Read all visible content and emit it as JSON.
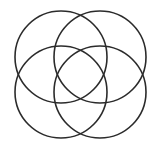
{
  "diagram": {
    "type": "four-circle-venn",
    "background": "#ffffff",
    "stroke_color": "#2b2b2b",
    "stroke_width": 1.6,
    "circles": [
      {
        "name": "top-left",
        "cx": 61,
        "cy": 57,
        "r": 46
      },
      {
        "name": "top-right",
        "cx": 100,
        "cy": 57,
        "r": 46
      },
      {
        "name": "bottom-left",
        "cx": 61,
        "cy": 92,
        "r": 46
      },
      {
        "name": "bottom-right",
        "cx": 100,
        "cy": 92,
        "r": 46
      }
    ]
  }
}
